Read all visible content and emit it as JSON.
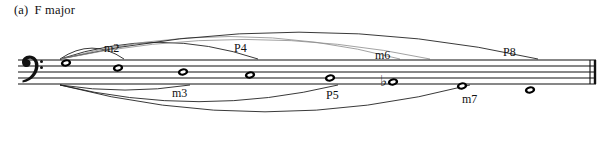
{
  "caption": {
    "tag": "(a)",
    "text": "F major"
  },
  "notation": {
    "clef": "bass-clef",
    "staff": {
      "x_start": 18,
      "x_end": 596,
      "top_line_y": 60,
      "line_gap": 6,
      "lines": 5
    },
    "barline_style": "final-double-barline",
    "accidentals": [
      {
        "note_index": 5,
        "symbol": "flat",
        "glyph": "♭"
      }
    ],
    "notes": [
      {
        "index": 0,
        "name": "F",
        "x": 66,
        "y": 63,
        "head": "whole"
      },
      {
        "index": 1,
        "name": "G",
        "x": 118,
        "y": 68,
        "head": "whole"
      },
      {
        "index": 2,
        "name": "A",
        "x": 183,
        "y": 72,
        "head": "whole"
      },
      {
        "index": 3,
        "name": "B",
        "x": 250,
        "y": 75,
        "head": "whole"
      },
      {
        "index": 4,
        "name": "C",
        "x": 330,
        "y": 78,
        "head": "whole"
      },
      {
        "index": 5,
        "name": "D",
        "x": 393,
        "y": 82,
        "head": "whole"
      },
      {
        "index": 6,
        "name": "E",
        "x": 462,
        "y": 86,
        "head": "whole"
      },
      {
        "index": 7,
        "name": "F2",
        "x": 530,
        "y": 90,
        "head": "whole"
      }
    ],
    "interval_labels": [
      {
        "id": "m2",
        "text": "m2",
        "x": 104,
        "y": 41,
        "position": "above"
      },
      {
        "id": "m3",
        "text": "m3",
        "x": 172,
        "y": 86,
        "position": "below"
      },
      {
        "id": "P4",
        "text": "P4",
        "x": 234,
        "y": 41,
        "position": "above"
      },
      {
        "id": "P5",
        "text": "P5",
        "x": 326,
        "y": 88,
        "position": "below"
      },
      {
        "id": "m6",
        "text": "m6",
        "x": 375,
        "y": 48,
        "position": "above"
      },
      {
        "id": "m7",
        "text": "m7",
        "x": 462,
        "y": 92,
        "position": "below"
      },
      {
        "id": "P8",
        "text": "P8",
        "x": 503,
        "y": 45,
        "position": "above"
      }
    ],
    "arcs": [
      {
        "id": "arc-m2",
        "side": "above",
        "from_x": 60,
        "to_x": 124,
        "peak_y": 44,
        "faint": false
      },
      {
        "id": "arc-m3",
        "side": "below",
        "from_x": 60,
        "to_x": 190,
        "peak_y": 92,
        "faint": false
      },
      {
        "id": "arc-P4",
        "side": "above",
        "from_x": 60,
        "to_x": 258,
        "peak_y": 36,
        "faint": false
      },
      {
        "id": "arc-P5",
        "side": "below",
        "from_x": 60,
        "to_x": 338,
        "peak_y": 108,
        "faint": false
      },
      {
        "id": "arc-m6",
        "side": "above",
        "from_x": 60,
        "to_x": 400,
        "peak_y": 28,
        "faint": true
      },
      {
        "id": "arc-m7",
        "side": "below",
        "from_x": 60,
        "to_x": 470,
        "peak_y": 122,
        "faint": false
      },
      {
        "id": "arc-P8",
        "side": "above",
        "from_x": 60,
        "to_x": 538,
        "peak_y": 22,
        "faint": false
      },
      {
        "id": "arc-m6b",
        "side": "above",
        "from_x": 60,
        "to_x": 430,
        "peak_y": 32,
        "faint": true
      }
    ]
  },
  "colors": {
    "ink": "#111111",
    "faint_ink": "#8a8a8a",
    "paper": "#ffffff"
  }
}
